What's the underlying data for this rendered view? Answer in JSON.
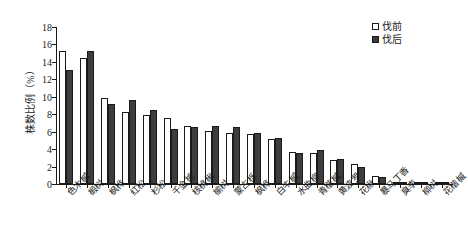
{
  "chart_data": {
    "type": "bar",
    "title": "",
    "xlabel": "",
    "ylabel": "株数比例（%）",
    "ylim": [
      0,
      18
    ],
    "yticks": [
      0,
      2,
      4,
      6,
      8,
      10,
      12,
      14,
      16,
      18
    ],
    "grid": false,
    "legend_position": "top-right",
    "categories": [
      "色木槭",
      "椴树",
      "枫桦",
      "红松",
      "杉松",
      "千金榆",
      "核桃楸",
      "榆树",
      "蒙古栎",
      "枫桦",
      "白牛槭",
      "水曲柳",
      "青楷槭",
      "黄波罗",
      "花楸",
      "暴马丁香",
      "臭李",
      "柳树",
      "花楷槭"
    ],
    "series": [
      {
        "name": "伐前",
        "color": "#ffffff",
        "values": [
          15.3,
          14.5,
          9.9,
          8.2,
          7.9,
          7.6,
          6.6,
          6.1,
          5.8,
          5.7,
          5.2,
          3.7,
          3.5,
          2.7,
          2.3,
          0.9,
          0.2,
          0.15,
          0.1
        ]
      },
      {
        "name": "伐后",
        "color": "#3d3d3d",
        "values": [
          13.1,
          15.2,
          9.2,
          9.6,
          8.5,
          6.3,
          6.5,
          6.7,
          6.5,
          5.9,
          5.3,
          3.6,
          3.9,
          2.9,
          2.0,
          0.8,
          0.2,
          0.2,
          0.1
        ]
      }
    ]
  },
  "legend": {
    "items": [
      {
        "label": "伐前",
        "style": "before"
      },
      {
        "label": "伐后",
        "style": "after"
      }
    ]
  }
}
